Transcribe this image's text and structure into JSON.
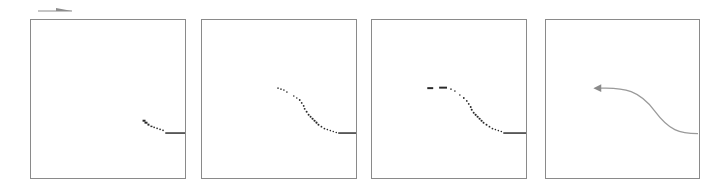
{
  "figure": {
    "legend_icon": "arrow-right-icon",
    "colors": {
      "frame": "#8a8a8a",
      "points": "#2a2a2a",
      "curve": "#9a9a9a",
      "legend_arrow": "#8c8c8c"
    },
    "panels": [
      {
        "id": 1,
        "style": "sparse-points",
        "left": 30,
        "width": 156
      },
      {
        "id": 2,
        "style": "dense-points",
        "left": 201,
        "width": 156
      },
      {
        "id": 3,
        "style": "dashed-points",
        "left": 371,
        "width": 156
      },
      {
        "id": 4,
        "style": "smooth-arrow-curve",
        "left": 545,
        "width": 155
      }
    ]
  }
}
